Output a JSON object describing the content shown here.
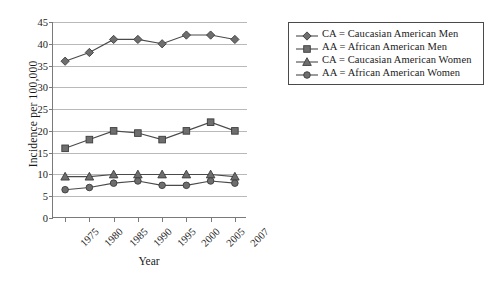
{
  "chart_data": {
    "type": "line",
    "title": "",
    "xlabel": "Year",
    "ylabel": "Incidence per 100,000",
    "categories": [
      "1975",
      "1980",
      "1985",
      "1990",
      "1995",
      "2000",
      "2005",
      "2007"
    ],
    "ylim": [
      0,
      45
    ],
    "ytick_step": 5,
    "yticks": [
      "0",
      "5",
      "10",
      "15",
      "20",
      "25",
      "30",
      "35",
      "40",
      "45"
    ],
    "grid": "horizontal",
    "legend_position": "right",
    "series": [
      {
        "name": "CA = Caucasian American Men",
        "marker": "diamond",
        "color": "#6e6e6e",
        "line_color": "#4a4a4a",
        "values": [
          36.0,
          38.0,
          41.0,
          41.0,
          40.0,
          42.0,
          42.0,
          41.0
        ]
      },
      {
        "name": "AA = African American Men",
        "marker": "square",
        "color": "#6e6e6e",
        "line_color": "#4a4a4a",
        "values": [
          16.0,
          18.0,
          20.0,
          19.5,
          18.0,
          20.0,
          22.0,
          20.0
        ]
      },
      {
        "name": "CA = Caucasian American Women",
        "marker": "triangle",
        "color": "#6e6e6e",
        "line_color": "#4a4a4a",
        "values": [
          9.5,
          9.5,
          10.0,
          10.0,
          10.0,
          10.0,
          10.0,
          9.5
        ]
      },
      {
        "name": "AA = African American Women",
        "marker": "circle",
        "color": "#6e6e6e",
        "line_color": "#4a4a4a",
        "values": [
          6.5,
          7.0,
          8.0,
          8.5,
          7.5,
          7.5,
          8.5,
          8.0
        ]
      }
    ]
  },
  "legend": {
    "items": [
      {
        "label": "CA = Caucasian American Men",
        "marker": "diamond"
      },
      {
        "label": "AA = African American Men",
        "marker": "square"
      },
      {
        "label": "CA = Caucasian American Women",
        "marker": "triangle"
      },
      {
        "label": "AA = African American Women",
        "marker": "circle"
      }
    ]
  },
  "colors": {
    "marker_fill": "#6e6e6e",
    "marker_stroke": "#3c3c3c",
    "line": "#4a4a4a",
    "gridline": "#b9b9b9",
    "axis": "#7a7a7a",
    "text": "#1a1a1a"
  }
}
